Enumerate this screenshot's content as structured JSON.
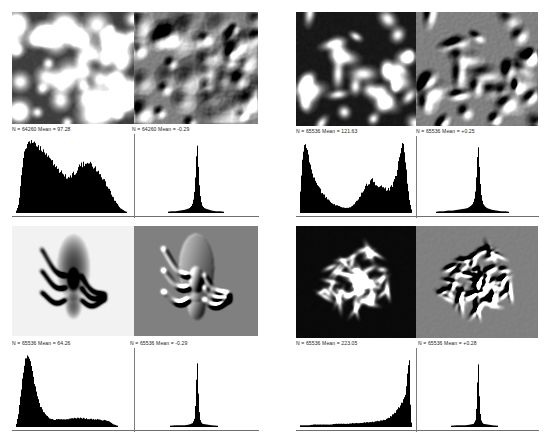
{
  "figure": {
    "layout": {
      "rows": 2,
      "cols": 2,
      "panels": 4
    }
  },
  "panels": [
    {
      "id": "panel-top-left",
      "subject": "blobs-clusters",
      "original": {
        "name": "original-image-blobs",
        "description": "Grayscale micrograph of bright round blob clusters on dark background",
        "stat": "N = 64260   Mean = 97.28",
        "n": "64260",
        "mean": "97.28"
      },
      "filtered": {
        "name": "embossed-image-blobs",
        "description": "Emboss filtered version of the blob micrograph, mid-gray relief",
        "stat": "N = 64260   Mean = -0.29",
        "n": "64260",
        "mean": "-0.29"
      }
    },
    {
      "id": "panel-top-right",
      "subject": "bacteria-rods",
      "original": {
        "name": "original-image-bacteria",
        "description": "High contrast grayscale image of bright irregular bacterial shapes",
        "stat": "N = 65536   Mean = 121.63",
        "n": "65536",
        "mean": "121.63"
      },
      "filtered": {
        "name": "embossed-image-bacteria",
        "description": "Emboss filtered version of the bacteria image, mid-gray relief",
        "stat": "N = 65536   Mean = +0.25",
        "n": "65536",
        "mean": "+0.25"
      }
    },
    {
      "id": "panel-bottom-left",
      "subject": "louse-insect",
      "original": {
        "name": "original-image-louse",
        "description": "Grayscale photomicrograph of a louse on a light background",
        "stat": "N = 65536   Mean = 64.26",
        "n": "65536",
        "mean": "64.26"
      },
      "filtered": {
        "name": "embossed-image-louse",
        "description": "Emboss filtered version of the louse image, mid-gray relief",
        "stat": "N = 65536   Mean = -0.29",
        "n": "65536",
        "mean": "-0.29"
      }
    },
    {
      "id": "panel-bottom-right",
      "subject": "chromosome-spread",
      "original": {
        "name": "original-image-chromosomes",
        "description": "Dark field image of a bright chromosome spread",
        "stat": "N = 65536   Mean = 223.05",
        "n": "65536",
        "mean": "223.05"
      },
      "filtered": {
        "name": "embossed-image-chromosomes",
        "description": "Emboss filtered version of the chromosome spread, mid-gray relief",
        "stat": "N = 65536   Mean = +0.28",
        "n": "65536",
        "mean": "+0.28"
      }
    }
  ],
  "chart_data": [
    {
      "type": "bar",
      "name": "histogram-blobs-original",
      "title": "N = 64260   Mean = 97.28",
      "xlabel": "",
      "ylabel": "",
      "xlim": [
        0,
        255
      ],
      "ylim": [
        0,
        1
      ],
      "grid": false,
      "legend": "none",
      "note": "Broad bimodal grayscale histogram; large mass from 15-120 peaking near 35, shallow dip near 135, secondary broad hump near 175, tail to 235",
      "x": [
        0,
        5,
        10,
        15,
        20,
        25,
        30,
        35,
        40,
        45,
        50,
        55,
        60,
        65,
        70,
        75,
        80,
        85,
        90,
        95,
        100,
        105,
        110,
        115,
        120,
        125,
        130,
        135,
        140,
        145,
        150,
        155,
        160,
        165,
        170,
        175,
        180,
        185,
        190,
        195,
        200,
        205,
        210,
        215,
        220,
        225,
        230,
        235,
        240,
        245,
        250,
        255
      ],
      "values": [
        0.02,
        0.1,
        0.42,
        0.72,
        0.86,
        0.93,
        0.97,
        1.0,
        0.95,
        0.92,
        0.89,
        0.87,
        0.84,
        0.8,
        0.78,
        0.74,
        0.7,
        0.66,
        0.62,
        0.58,
        0.55,
        0.52,
        0.5,
        0.49,
        0.48,
        0.5,
        0.53,
        0.57,
        0.61,
        0.64,
        0.66,
        0.67,
        0.68,
        0.67,
        0.65,
        0.63,
        0.6,
        0.56,
        0.52,
        0.47,
        0.42,
        0.36,
        0.3,
        0.24,
        0.18,
        0.13,
        0.09,
        0.05,
        0.03,
        0.01,
        0.0,
        0.0
      ]
    },
    {
      "type": "bar",
      "name": "histogram-blobs-embossed",
      "title": "N = 64260   Mean = -0.29",
      "xlabel": "",
      "ylabel": "",
      "xlim": [
        0,
        255
      ],
      "ylim": [
        0,
        1
      ],
      "grid": false,
      "legend": "none",
      "note": "Single very narrow spike centered at mid gray (128) with thin symmetric skirts",
      "x": [
        0,
        10,
        20,
        30,
        40,
        50,
        60,
        70,
        80,
        90,
        100,
        105,
        110,
        115,
        118,
        120,
        122,
        124,
        126,
        128,
        130,
        132,
        134,
        136,
        138,
        140,
        145,
        150,
        155,
        160,
        170,
        180,
        190,
        200,
        210,
        220,
        230,
        240,
        250,
        255
      ],
      "values": [
        0,
        0,
        0,
        0,
        0,
        0,
        0,
        0.01,
        0.01,
        0.02,
        0.03,
        0.04,
        0.05,
        0.08,
        0.12,
        0.18,
        0.28,
        0.45,
        0.72,
        1.0,
        0.74,
        0.46,
        0.29,
        0.18,
        0.12,
        0.08,
        0.05,
        0.04,
        0.03,
        0.02,
        0.01,
        0.01,
        0,
        0,
        0,
        0,
        0,
        0,
        0,
        0
      ]
    },
    {
      "type": "bar",
      "name": "histogram-bacteria-original",
      "title": "N = 65536   Mean = 121.63",
      "xlabel": "",
      "ylabel": "",
      "xlim": [
        0,
        255
      ],
      "ylim": [
        0,
        1
      ],
      "grid": false,
      "legend": "none",
      "note": "Strongly bimodal: tall narrow peak at dark end near 10-25, deep valley near 110, broad middle hump near 165, tall peak near 235",
      "x": [
        0,
        5,
        10,
        15,
        20,
        25,
        30,
        35,
        40,
        45,
        50,
        55,
        60,
        65,
        70,
        75,
        80,
        85,
        90,
        95,
        100,
        105,
        110,
        115,
        120,
        125,
        130,
        135,
        140,
        145,
        150,
        155,
        160,
        165,
        170,
        175,
        180,
        185,
        190,
        195,
        200,
        205,
        210,
        215,
        220,
        225,
        230,
        235,
        240,
        245,
        250,
        255
      ],
      "values": [
        0.3,
        0.78,
        0.95,
        0.88,
        0.74,
        0.62,
        0.52,
        0.44,
        0.37,
        0.32,
        0.27,
        0.23,
        0.2,
        0.17,
        0.14,
        0.12,
        0.1,
        0.09,
        0.08,
        0.07,
        0.06,
        0.06,
        0.06,
        0.07,
        0.09,
        0.12,
        0.16,
        0.21,
        0.26,
        0.32,
        0.37,
        0.41,
        0.43,
        0.45,
        0.42,
        0.4,
        0.37,
        0.36,
        0.34,
        0.33,
        0.32,
        0.33,
        0.36,
        0.42,
        0.52,
        0.68,
        0.86,
        1.0,
        0.82,
        0.48,
        0.18,
        0.04
      ]
    },
    {
      "type": "bar",
      "name": "histogram-bacteria-embossed",
      "title": "N = 65536   Mean = +0.25",
      "xlabel": "",
      "ylabel": "",
      "xlim": [
        0,
        255
      ],
      "ylim": [
        0,
        1
      ],
      "grid": false,
      "legend": "none",
      "note": "Single narrow spike at mid gray with low broad skirts",
      "x": [
        0,
        10,
        20,
        30,
        40,
        50,
        60,
        70,
        80,
        90,
        100,
        105,
        110,
        115,
        118,
        120,
        122,
        124,
        126,
        128,
        130,
        132,
        134,
        136,
        138,
        140,
        145,
        150,
        155,
        160,
        170,
        180,
        190,
        200,
        210,
        220,
        230,
        240,
        250,
        255
      ],
      "values": [
        0,
        0,
        0,
        0,
        0.01,
        0.01,
        0.02,
        0.02,
        0.03,
        0.04,
        0.05,
        0.06,
        0.08,
        0.11,
        0.15,
        0.2,
        0.3,
        0.48,
        0.74,
        1.0,
        0.76,
        0.5,
        0.32,
        0.21,
        0.15,
        0.11,
        0.07,
        0.05,
        0.04,
        0.03,
        0.02,
        0.01,
        0.01,
        0,
        0,
        0,
        0,
        0,
        0,
        0
      ]
    },
    {
      "type": "bar",
      "name": "histogram-louse-original",
      "title": "N = 65536   Mean = 64.26",
      "xlabel": "",
      "ylabel": "",
      "xlim": [
        0,
        255
      ],
      "ylim": [
        0,
        1
      ],
      "grid": false,
      "legend": "none",
      "note": "Tall narrow peak near 25-35 with a long low flat tail extending right to about 215",
      "x": [
        0,
        5,
        10,
        15,
        20,
        25,
        30,
        35,
        40,
        45,
        50,
        55,
        60,
        65,
        70,
        75,
        80,
        85,
        90,
        95,
        100,
        105,
        110,
        115,
        120,
        125,
        130,
        135,
        140,
        145,
        150,
        155,
        160,
        165,
        170,
        175,
        180,
        185,
        190,
        195,
        200,
        205,
        210,
        215,
        220,
        225,
        230,
        235,
        240,
        245,
        250,
        255
      ],
      "values": [
        0.03,
        0.18,
        0.46,
        0.72,
        0.9,
        1.0,
        0.93,
        0.78,
        0.6,
        0.45,
        0.34,
        0.26,
        0.2,
        0.16,
        0.13,
        0.11,
        0.1,
        0.09,
        0.09,
        0.09,
        0.09,
        0.09,
        0.09,
        0.1,
        0.1,
        0.1,
        0.11,
        0.11,
        0.11,
        0.11,
        0.11,
        0.1,
        0.1,
        0.1,
        0.1,
        0.09,
        0.09,
        0.09,
        0.09,
        0.08,
        0.08,
        0.07,
        0.06,
        0.04,
        0.02,
        0.01,
        0,
        0,
        0,
        0,
        0,
        0
      ]
    },
    {
      "type": "bar",
      "name": "histogram-louse-embossed",
      "title": "N = 65536   Mean = -0.29",
      "xlabel": "",
      "ylabel": "",
      "xlim": [
        0,
        255
      ],
      "ylim": [
        0,
        1
      ],
      "grid": false,
      "legend": "none",
      "note": "Extremely narrow single spike at mid gray, nearly zero elsewhere",
      "x": [
        0,
        20,
        40,
        60,
        80,
        100,
        110,
        118,
        122,
        124,
        126,
        128,
        130,
        132,
        134,
        136,
        140,
        150,
        160,
        180,
        200,
        220,
        240,
        255
      ],
      "values": [
        0,
        0,
        0,
        0,
        0.01,
        0.01,
        0.02,
        0.04,
        0.1,
        0.25,
        0.55,
        1.0,
        0.58,
        0.27,
        0.12,
        0.06,
        0.03,
        0.02,
        0.01,
        0,
        0,
        0,
        0,
        0
      ]
    },
    {
      "type": "bar",
      "name": "histogram-chromosomes-original",
      "title": "N = 65536   Mean = 223.05",
      "xlabel": "",
      "ylabel": "",
      "xlim": [
        0,
        255
      ],
      "ylim": [
        0,
        1
      ],
      "grid": false,
      "legend": "none",
      "note": "Very low flat response across most of the range rising steeply to a tall narrow spike at the bright end near 250",
      "x": [
        0,
        10,
        20,
        30,
        40,
        50,
        60,
        70,
        80,
        90,
        100,
        110,
        120,
        130,
        140,
        150,
        160,
        170,
        180,
        190,
        200,
        205,
        210,
        215,
        220,
        225,
        230,
        235,
        240,
        243,
        246,
        248,
        250,
        252,
        255
      ],
      "values": [
        0.01,
        0.01,
        0.01,
        0.02,
        0.02,
        0.02,
        0.02,
        0.02,
        0.03,
        0.03,
        0.03,
        0.03,
        0.04,
        0.04,
        0.04,
        0.05,
        0.05,
        0.06,
        0.07,
        0.08,
        0.1,
        0.12,
        0.14,
        0.17,
        0.2,
        0.24,
        0.28,
        0.34,
        0.42,
        0.52,
        0.7,
        0.86,
        1.0,
        0.4,
        0.05
      ]
    },
    {
      "type": "bar",
      "name": "histogram-chromosomes-embossed",
      "title": "N = 65536   Mean = +0.28",
      "xlabel": "",
      "ylabel": "",
      "xlim": [
        0,
        255
      ],
      "ylim": [
        0,
        1
      ],
      "grid": false,
      "legend": "none",
      "note": "Extremely narrow single spike at mid gray",
      "x": [
        0,
        20,
        40,
        60,
        80,
        100,
        110,
        118,
        122,
        124,
        126,
        128,
        130,
        132,
        134,
        136,
        140,
        150,
        160,
        180,
        200,
        220,
        240,
        255
      ],
      "values": [
        0,
        0,
        0,
        0,
        0.01,
        0.01,
        0.02,
        0.03,
        0.08,
        0.22,
        0.52,
        1.0,
        0.55,
        0.24,
        0.11,
        0.06,
        0.03,
        0.02,
        0.01,
        0,
        0,
        0,
        0,
        0
      ]
    }
  ]
}
